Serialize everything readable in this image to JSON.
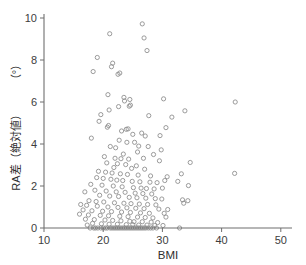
{
  "chart_data": {
    "type": "scatter",
    "title": "",
    "xlabel": "BMI",
    "ylabel": "RA差（絶対値）（°）",
    "ylabel_main": "RA差（絶対値）",
    "ylabel_unit": "（°）",
    "xlim": [
      10,
      53
    ],
    "ylim": [
      0,
      10.4
    ],
    "xticks": [
      10,
      20,
      30,
      40,
      50
    ],
    "yticks": [
      0,
      2,
      4,
      6,
      8,
      10
    ],
    "xtick_labels": [
      "10",
      "20",
      "30",
      "40",
      "50"
    ],
    "ytick_labels": [
      "0",
      "2",
      "4",
      "6",
      "8",
      "10"
    ],
    "grid": false,
    "legend": null,
    "marker": "open-circle",
    "marker_color": "#8a8a8a",
    "marker_size": 4.2,
    "points": [
      [
        26.6,
        9.72
      ],
      [
        21.1,
        9.25
      ],
      [
        26.9,
        9.05
      ],
      [
        27.4,
        8.45
      ],
      [
        19.0,
        8.12
      ],
      [
        21.6,
        7.85
      ],
      [
        21.4,
        7.68
      ],
      [
        18.3,
        7.45
      ],
      [
        22.8,
        7.38
      ],
      [
        22.5,
        7.32
      ],
      [
        20.8,
        6.35
      ],
      [
        23.5,
        6.22
      ],
      [
        24.5,
        6.12
      ],
      [
        30.2,
        6.15
      ],
      [
        42.3,
        6.0
      ],
      [
        23.6,
        6.05
      ],
      [
        24.6,
        5.85
      ],
      [
        22.6,
        5.78
      ],
      [
        24.4,
        5.8
      ],
      [
        21.0,
        5.62
      ],
      [
        33.8,
        5.58
      ],
      [
        19.6,
        5.4
      ],
      [
        27.7,
        5.35
      ],
      [
        31.6,
        5.28
      ],
      [
        19.3,
        5.08
      ],
      [
        20.9,
        4.88
      ],
      [
        20.7,
        4.8
      ],
      [
        23.9,
        4.7
      ],
      [
        23.1,
        4.62
      ],
      [
        24.2,
        4.72
      ],
      [
        30.6,
        4.78
      ],
      [
        26.5,
        4.52
      ],
      [
        25.0,
        4.46
      ],
      [
        27.1,
        4.38
      ],
      [
        29.6,
        4.4
      ],
      [
        18.0,
        4.28
      ],
      [
        22.7,
        4.18
      ],
      [
        25.3,
        4.08
      ],
      [
        24.0,
        4.08
      ],
      [
        26.0,
        3.9
      ],
      [
        21.2,
        3.88
      ],
      [
        22.1,
        3.82
      ],
      [
        27.6,
        3.88
      ],
      [
        29.8,
        3.72
      ],
      [
        25.8,
        3.62
      ],
      [
        23.4,
        3.52
      ],
      [
        28.5,
        3.5
      ],
      [
        20.2,
        3.4
      ],
      [
        22.0,
        3.32
      ],
      [
        23.0,
        3.3
      ],
      [
        24.3,
        3.28
      ],
      [
        26.8,
        3.32
      ],
      [
        29.5,
        3.2
      ],
      [
        34.7,
        3.12
      ],
      [
        20.6,
        3.1
      ],
      [
        22.4,
        3.06
      ],
      [
        23.8,
        3.02
      ],
      [
        25.6,
        2.96
      ],
      [
        21.8,
        2.88
      ],
      [
        24.8,
        2.84
      ],
      [
        27.0,
        2.8
      ],
      [
        19.2,
        2.7
      ],
      [
        20.4,
        2.66
      ],
      [
        21.5,
        2.62
      ],
      [
        22.9,
        2.58
      ],
      [
        24.1,
        2.55
      ],
      [
        25.9,
        2.52
      ],
      [
        28.0,
        2.48
      ],
      [
        30.8,
        2.44
      ],
      [
        33.2,
        2.58
      ],
      [
        42.2,
        2.6
      ],
      [
        18.9,
        2.4
      ],
      [
        20.0,
        2.36
      ],
      [
        21.3,
        2.32
      ],
      [
        22.3,
        2.28
      ],
      [
        23.3,
        2.26
      ],
      [
        24.9,
        2.22
      ],
      [
        26.2,
        2.2
      ],
      [
        27.9,
        2.18
      ],
      [
        29.1,
        2.16
      ],
      [
        30.4,
        2.26
      ],
      [
        32.6,
        2.22
      ],
      [
        34.4,
        2.02
      ],
      [
        17.9,
        2.08
      ],
      [
        19.8,
        2.04
      ],
      [
        21.7,
        2.0
      ],
      [
        23.2,
        1.96
      ],
      [
        25.1,
        1.92
      ],
      [
        26.4,
        1.9
      ],
      [
        27.3,
        1.88
      ],
      [
        28.6,
        1.86
      ],
      [
        30.0,
        1.9
      ],
      [
        18.6,
        1.8
      ],
      [
        20.5,
        1.76
      ],
      [
        22.2,
        1.72
      ],
      [
        23.7,
        1.7
      ],
      [
        25.4,
        1.66
      ],
      [
        26.7,
        1.64
      ],
      [
        28.2,
        1.62
      ],
      [
        16.9,
        1.72
      ],
      [
        19.4,
        1.56
      ],
      [
        21.1,
        1.52
      ],
      [
        22.6,
        1.5
      ],
      [
        24.4,
        1.46
      ],
      [
        25.7,
        1.44
      ],
      [
        27.2,
        1.42
      ],
      [
        28.8,
        1.4
      ],
      [
        29.9,
        1.38
      ],
      [
        33.4,
        1.34
      ],
      [
        34.3,
        1.3
      ],
      [
        17.6,
        1.3
      ],
      [
        18.8,
        1.26
      ],
      [
        20.1,
        1.24
      ],
      [
        21.9,
        1.2
      ],
      [
        23.5,
        1.18
      ],
      [
        24.7,
        1.16
      ],
      [
        26.1,
        1.14
      ],
      [
        27.5,
        1.12
      ],
      [
        28.9,
        1.1
      ],
      [
        33.6,
        1.18
      ],
      [
        16.2,
        1.12
      ],
      [
        17.2,
        1.08
      ],
      [
        19.0,
        1.04
      ],
      [
        20.8,
        1.0
      ],
      [
        22.5,
        0.98
      ],
      [
        24.0,
        0.96
      ],
      [
        25.5,
        0.94
      ],
      [
        26.9,
        0.92
      ],
      [
        29.4,
        0.9
      ],
      [
        30.9,
        0.88
      ],
      [
        16.6,
        0.86
      ],
      [
        18.1,
        0.82
      ],
      [
        19.9,
        0.8
      ],
      [
        21.4,
        0.78
      ],
      [
        23.1,
        0.76
      ],
      [
        24.6,
        0.74
      ],
      [
        26.3,
        0.72
      ],
      [
        27.8,
        0.7
      ],
      [
        30.3,
        0.7
      ],
      [
        16.0,
        0.66
      ],
      [
        17.5,
        0.62
      ],
      [
        19.5,
        0.6
      ],
      [
        20.9,
        0.58
      ],
      [
        22.8,
        0.56
      ],
      [
        24.2,
        0.54
      ],
      [
        25.8,
        0.52
      ],
      [
        27.1,
        0.5
      ],
      [
        28.4,
        0.48
      ],
      [
        30.6,
        0.52
      ],
      [
        17.0,
        0.42
      ],
      [
        18.5,
        0.4
      ],
      [
        20.3,
        0.38
      ],
      [
        21.6,
        0.36
      ],
      [
        23.0,
        0.34
      ],
      [
        24.5,
        0.32
      ],
      [
        25.2,
        0.3
      ],
      [
        26.6,
        0.3
      ],
      [
        28.1,
        0.28
      ],
      [
        29.2,
        0.26
      ],
      [
        18.2,
        0.22
      ],
      [
        19.7,
        0.2
      ],
      [
        21.0,
        0.18
      ],
      [
        22.4,
        0.18
      ],
      [
        23.9,
        0.16
      ],
      [
        25.0,
        0.16
      ],
      [
        26.0,
        0.14
      ],
      [
        27.4,
        0.14
      ],
      [
        28.7,
        0.12
      ],
      [
        17.3,
        0.14
      ],
      [
        30.1,
        0.12
      ],
      [
        17.8,
        0.0
      ],
      [
        18.4,
        0.0
      ],
      [
        18.7,
        0.0
      ],
      [
        19.1,
        0.0
      ],
      [
        19.6,
        0.0
      ],
      [
        20.0,
        0.0
      ],
      [
        20.4,
        0.0
      ],
      [
        20.7,
        0.0
      ],
      [
        21.2,
        0.0
      ],
      [
        21.5,
        0.0
      ],
      [
        21.8,
        0.0
      ],
      [
        22.1,
        0.0
      ],
      [
        22.4,
        0.0
      ],
      [
        22.7,
        0.0
      ],
      [
        23.0,
        0.0
      ],
      [
        23.3,
        0.0
      ],
      [
        23.6,
        0.0
      ],
      [
        23.9,
        0.0
      ],
      [
        24.2,
        0.0
      ],
      [
        24.5,
        0.0
      ],
      [
        24.8,
        0.0
      ],
      [
        25.1,
        0.0
      ],
      [
        25.4,
        0.0
      ],
      [
        25.7,
        0.0
      ],
      [
        26.0,
        0.0
      ],
      [
        26.3,
        0.0
      ],
      [
        26.6,
        0.0
      ],
      [
        26.9,
        0.0
      ],
      [
        27.2,
        0.0
      ],
      [
        27.6,
        0.0
      ],
      [
        28.0,
        0.0
      ],
      [
        28.4,
        0.0
      ],
      [
        29.0,
        0.0
      ],
      [
        32.9,
        0.0
      ]
    ]
  }
}
